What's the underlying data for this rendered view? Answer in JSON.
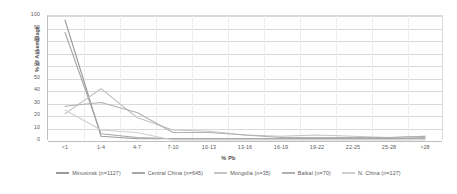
{
  "chart_data": {
    "type": "line",
    "title": "",
    "xlabel": "% Pb",
    "ylabel": "% of Assemblage",
    "categories": [
      "<1",
      "1-4",
      "4-7",
      "7-10",
      "10-13",
      "13-16",
      "16-19",
      "19-22",
      "22-25",
      "25-28",
      ">28"
    ],
    "ylim": [
      0,
      100
    ],
    "yticks": [
      0,
      10,
      20,
      30,
      40,
      50,
      60,
      70,
      80,
      90,
      100
    ],
    "grid": true,
    "legend_position": "bottom",
    "series": [
      {
        "name": "Minusinsk (n=1127)",
        "color": "#9a9a9a",
        "values": [
          96,
          3,
          1,
          1,
          1,
          1,
          1,
          1,
          1,
          1,
          1
        ]
      },
      {
        "name": "Central China (n=645)",
        "color": "#a6a6a6",
        "values": [
          86,
          5,
          2,
          1,
          1,
          1,
          1,
          1,
          1,
          1,
          2
        ]
      },
      {
        "name": "Mongolia (n=35)",
        "color": "#c4c4c4",
        "values": [
          21,
          41,
          18,
          8,
          7,
          4,
          3,
          4,
          3,
          2,
          3
        ]
      },
      {
        "name": "Baikal (n=70)",
        "color": "#b0b0b0",
        "values": [
          27,
          30,
          22,
          6,
          6,
          4,
          2,
          2,
          2,
          2,
          3
        ]
      },
      {
        "name": "N. China (n=127)",
        "color": "#cfcfcf",
        "values": [
          24,
          8,
          6,
          0,
          0,
          0,
          0,
          0,
          0,
          0,
          0
        ]
      }
    ]
  }
}
